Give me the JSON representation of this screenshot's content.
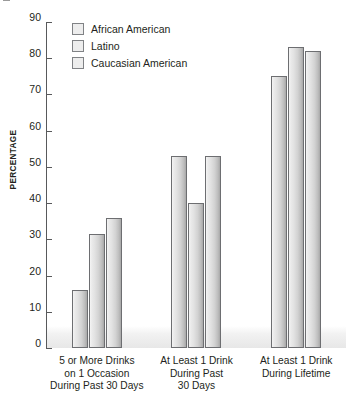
{
  "chart_data": {
    "type": "bar",
    "title": "",
    "xlabel": "",
    "ylabel": "PERCENTAGE",
    "ylim": [
      0,
      90
    ],
    "yticks": [
      0,
      10,
      20,
      30,
      40,
      50,
      60,
      70,
      80,
      90
    ],
    "grid": false,
    "legend_position": "top-left inside plot",
    "categories": [
      "5 or More Drinks on 1 Occasion During Past 30 Days",
      "At Least 1 Drink During Past 30 Days",
      "At Least 1 Drink During Lifetime"
    ],
    "category_lines": [
      [
        "5 or More Drinks",
        "on 1 Occasion",
        "During Past 30 Days"
      ],
      [
        "At Least 1 Drink",
        "During Past",
        "30 Days"
      ],
      [
        "At Least 1 Drink",
        "During Lifetime"
      ]
    ],
    "series": [
      {
        "name": "African American",
        "values": [
          16,
          53,
          75
        ]
      },
      {
        "name": "Latino",
        "values": [
          31.5,
          40,
          83
        ]
      },
      {
        "name": "Caucasian American",
        "values": [
          36,
          53,
          82
        ]
      }
    ],
    "colors": {
      "bar_fill_light": "#f4f4f4",
      "bar_fill_dark": "#a8a8a8",
      "bar_border": "#6d6e71",
      "axis": "#58595b",
      "text": "#231f20",
      "swatch_fill": "#ededed",
      "swatch_border": "#808285",
      "floor_band": "#e7e7e7"
    }
  }
}
